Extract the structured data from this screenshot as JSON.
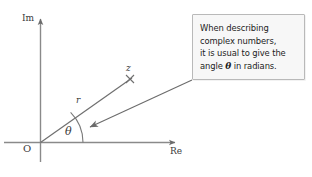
{
  "figure": {
    "type": "argand-diagram",
    "background_color": "#ffffff",
    "axes": {
      "imaginary_label": "Im",
      "real_label": "Re",
      "origin_label": "O",
      "axis_color": "#8a8a8a"
    },
    "vector": {
      "magnitude_label": "r",
      "point_label": "z",
      "angle_label": "θ",
      "point_marker": "x-cross-marker",
      "line_color": "#6f6f6f",
      "arc_color": "#7a7a7a"
    },
    "callout": {
      "line1": "When describing",
      "line2": "complex numbers,",
      "line3_before": "it is usual to give the",
      "line4_before": "angle ",
      "line4_symbol": "θ",
      "line4_after": " in radians.",
      "full_text": "When describing complex numbers, it is usual to give the angle θ in radians.",
      "background_color": "#f7f7f7",
      "border_color": "#b9b9b9",
      "text_color": "#222222",
      "pointer": "leader-arrow-to-angle-arc"
    }
  }
}
